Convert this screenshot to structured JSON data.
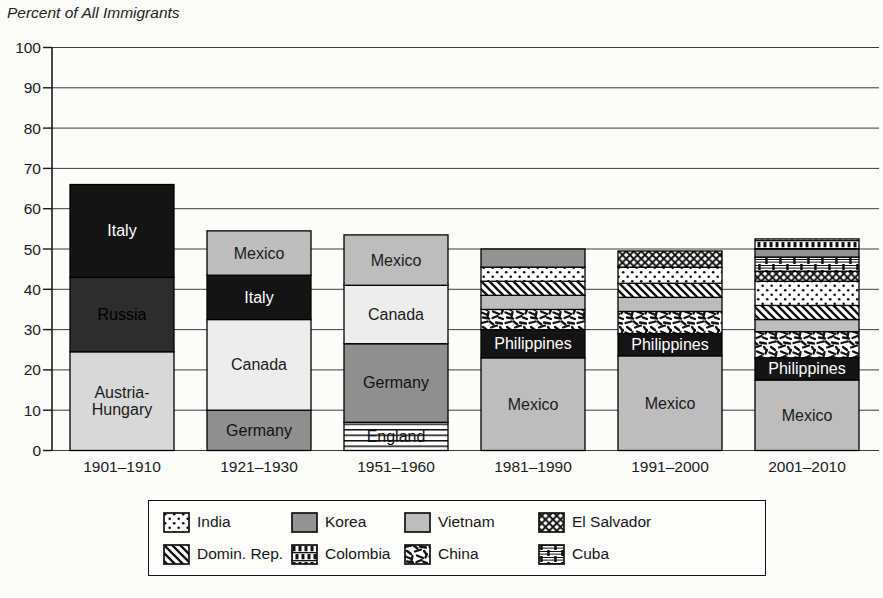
{
  "page": {
    "background": "#fcfcfa"
  },
  "chart_data": {
    "type": "stacked-bar",
    "title": "Percent of All Immigrants",
    "xlabel": "",
    "ylabel": "Percent of All Immigrants",
    "ylim": [
      0,
      100
    ],
    "yticks": [
      0,
      10,
      20,
      30,
      40,
      50,
      60,
      70,
      80,
      90,
      100
    ],
    "grid": true,
    "legend_position": "bottom",
    "categories": [
      "1901–1910",
      "1921–1930",
      "1951–1960",
      "1981–1990",
      "1991–2000",
      "2001–2010"
    ],
    "bars": [
      {
        "category": "1901–1910",
        "total": 66,
        "segments": [
          {
            "country": "Austria-Hungary",
            "value": 24.5,
            "style": "austria_hungary",
            "bar_label": "Austria-|Hungary",
            "label_color": "#1a1a1a"
          },
          {
            "country": "Russia",
            "value": 18.5,
            "style": "russia",
            "bar_label": "Russia",
            "label_color": "#000000"
          },
          {
            "country": "Italy",
            "value": 23,
            "style": "italy",
            "bar_label": "Italy",
            "label_color": "#ffffff"
          }
        ]
      },
      {
        "category": "1921–1930",
        "total": 54.5,
        "segments": [
          {
            "country": "Germany",
            "value": 10,
            "style": "germany",
            "bar_label": "Germany",
            "label_color": "#111111"
          },
          {
            "country": "Canada",
            "value": 22.5,
            "style": "canada",
            "bar_label": "Canada",
            "label_color": "#1a1a1a"
          },
          {
            "country": "Italy",
            "value": 11,
            "style": "italy",
            "bar_label": "Italy",
            "label_color": "#ffffff"
          },
          {
            "country": "Mexico",
            "value": 11,
            "style": "mexico",
            "bar_label": "Mexico",
            "label_color": "#1a1a1a"
          }
        ]
      },
      {
        "category": "1951–1960",
        "total": 53.5,
        "segments": [
          {
            "country": "England",
            "value": 7,
            "style": "england",
            "bar_label": "England",
            "label_color": "#111111"
          },
          {
            "country": "Germany",
            "value": 19.5,
            "style": "germany",
            "bar_label": "Germany",
            "label_color": "#111111"
          },
          {
            "country": "Canada",
            "value": 14.5,
            "style": "canada",
            "bar_label": "Canada",
            "label_color": "#1a1a1a"
          },
          {
            "country": "Mexico",
            "value": 12.5,
            "style": "mexico",
            "bar_label": "Mexico",
            "label_color": "#1a1a1a"
          }
        ]
      },
      {
        "category": "1981–1990",
        "total": 50,
        "segments": [
          {
            "country": "Mexico",
            "value": 23,
            "style": "mexico",
            "bar_label": "Mexico",
            "label_color": "#1a1a1a"
          },
          {
            "country": "Philippines",
            "value": 7,
            "style": "philippines",
            "bar_label": "Philippines",
            "label_color": "#ffffff"
          },
          {
            "country": "China",
            "value": 5,
            "style": "china"
          },
          {
            "country": "Vietnam",
            "value": 3.5,
            "style": "vietnam"
          },
          {
            "country": "Dominican Republic",
            "value": 3.5,
            "style": "domin_rep"
          },
          {
            "country": "India",
            "value": 3.5,
            "style": "india"
          },
          {
            "country": "Korea",
            "value": 4.5,
            "style": "korea"
          }
        ]
      },
      {
        "category": "1991–2000",
        "total": 49.5,
        "segments": [
          {
            "country": "Mexico",
            "value": 23.5,
            "style": "mexico",
            "bar_label": "Mexico",
            "label_color": "#1a1a1a"
          },
          {
            "country": "Philippines",
            "value": 5.5,
            "style": "philippines",
            "bar_label": "Philippines",
            "label_color": "#ffffff"
          },
          {
            "country": "China",
            "value": 5.5,
            "style": "china"
          },
          {
            "country": "Vietnam",
            "value": 3.5,
            "style": "vietnam"
          },
          {
            "country": "Dominican Republic",
            "value": 3.5,
            "style": "domin_rep"
          },
          {
            "country": "India",
            "value": 4,
            "style": "india"
          },
          {
            "country": "El Salvador",
            "value": 4,
            "style": "el_salvador"
          }
        ]
      },
      {
        "category": "2001–2010",
        "total": 52.5,
        "segments": [
          {
            "country": "Mexico",
            "value": 17.5,
            "style": "mexico",
            "bar_label": "Mexico",
            "label_color": "#1a1a1a"
          },
          {
            "country": "Philippines",
            "value": 5.5,
            "style": "philippines",
            "bar_label": "Philippines",
            "label_color": "#ffffff"
          },
          {
            "country": "China",
            "value": 6.5,
            "style": "china"
          },
          {
            "country": "Vietnam",
            "value": 3,
            "style": "vietnam"
          },
          {
            "country": "Dominican Republic",
            "value": 3.5,
            "style": "domin_rep"
          },
          {
            "country": "India",
            "value": 6,
            "style": "india"
          },
          {
            "country": "El Salvador",
            "value": 2.5,
            "style": "el_salvador"
          },
          {
            "country": "Cuba",
            "value": 3.5,
            "style": "cuba"
          },
          {
            "country": "Korea",
            "value": 2,
            "style": "korea"
          },
          {
            "country": "Colombia",
            "value": 2.5,
            "style": "colombia"
          }
        ]
      }
    ],
    "legend": [
      {
        "label": "India",
        "style": "india"
      },
      {
        "label": "Korea",
        "style": "korea"
      },
      {
        "label": "Vietnam",
        "style": "vietnam"
      },
      {
        "label": "El Salvador",
        "style": "el_salvador"
      },
      {
        "label": "Domin. Rep.",
        "style": "domin_rep"
      },
      {
        "label": "Colombia",
        "style": "colombia"
      },
      {
        "label": "China",
        "style": "china"
      },
      {
        "label": "Cuba",
        "style": "cuba"
      }
    ]
  },
  "styles": {
    "austria_hungary": {
      "fill": "solid",
      "color": "#d8d8d8"
    },
    "russia": {
      "fill": "solid",
      "color": "#2d2d2d"
    },
    "italy": {
      "fill": "solid",
      "color": "#141414"
    },
    "philippines": {
      "fill": "solid",
      "color": "#141414"
    },
    "germany": {
      "fill": "solid",
      "color": "#8f8f8f"
    },
    "canada": {
      "fill": "solid",
      "color": "#ededed"
    },
    "mexico": {
      "fill": "solid",
      "color": "#bdbdbd"
    },
    "vietnam": {
      "fill": "solid",
      "color": "#bdbdbd"
    },
    "korea": {
      "fill": "solid",
      "color": "#939393"
    },
    "england": {
      "fill": "pattern",
      "pattern": "pat-england"
    },
    "india": {
      "fill": "pattern",
      "pattern": "pat-india"
    },
    "domin_rep": {
      "fill": "pattern",
      "pattern": "pat-dominrep"
    },
    "china": {
      "fill": "pattern",
      "pattern": "pat-china"
    },
    "el_salvador": {
      "fill": "pattern",
      "pattern": "pat-elsalvador"
    },
    "colombia": {
      "fill": "pattern",
      "pattern": "pat-colombia"
    },
    "cuba": {
      "fill": "pattern",
      "pattern": "pat-cuba"
    }
  },
  "axis_color": "#1a1a1a",
  "gridline_color": "#3c3c3c",
  "bar_border_color": "#000000"
}
